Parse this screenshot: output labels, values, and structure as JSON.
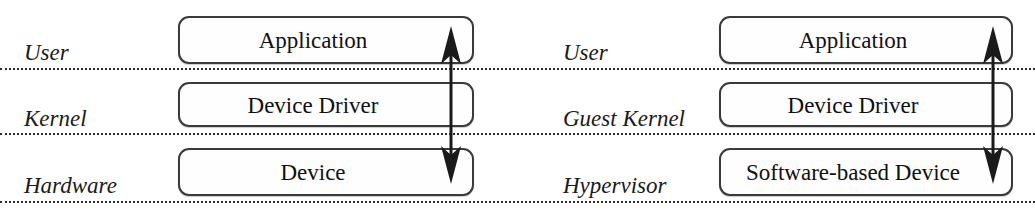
{
  "diagram": {
    "colors": {
      "box_border": "#3a3a3a",
      "box_fill": "#fefefe",
      "separator": "#2b2b2b",
      "arrow": "#1a1a1a",
      "text": "#101010"
    },
    "panels": [
      {
        "id": "native",
        "name": "native-stack",
        "layer_labels": [
          {
            "name": "layer-label-user",
            "text": "User"
          },
          {
            "name": "layer-label-kernel",
            "text": "Kernel"
          },
          {
            "name": "layer-label-hardware",
            "text": "Hardware"
          }
        ],
        "boxes": [
          {
            "name": "box-application",
            "text": "Application"
          },
          {
            "name": "box-device-driver",
            "text": "Device Driver"
          },
          {
            "name": "box-device",
            "text": "Device"
          }
        ],
        "arrow": {
          "name": "bidirectional-arrow",
          "direction": "both",
          "from": "Application",
          "to": "Device"
        }
      },
      {
        "id": "virtualized",
        "name": "virtualized-stack",
        "layer_labels": [
          {
            "name": "layer-label-user",
            "text": "User"
          },
          {
            "name": "layer-label-guest-kernel",
            "text": "Guest Kernel"
          },
          {
            "name": "layer-label-hypervisor",
            "text": "Hypervisor"
          }
        ],
        "boxes": [
          {
            "name": "box-application",
            "text": "Application"
          },
          {
            "name": "box-device-driver",
            "text": "Device Driver"
          },
          {
            "name": "box-software-based-device",
            "text": "Software-based Device"
          }
        ],
        "arrow": {
          "name": "bidirectional-arrow",
          "direction": "both",
          "from": "Application",
          "to": "Software-based Device"
        }
      }
    ]
  }
}
